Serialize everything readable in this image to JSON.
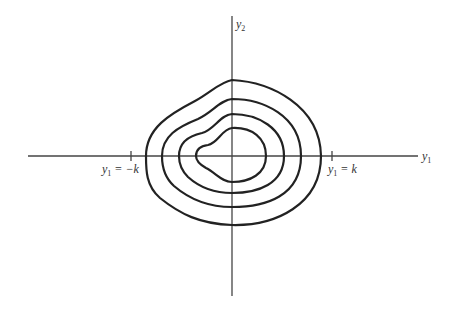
{
  "diagram": {
    "type": "contour-plot",
    "axes": {
      "x_label": "y",
      "x_label_sub": "1",
      "y_label": "y",
      "y_label_sub": "2"
    },
    "ticks": {
      "left": {
        "label_var": "y",
        "label_sub": "1",
        "label_rest": " = −k"
      },
      "right": {
        "label_var": "y",
        "label_sub": "1",
        "label_rest": " = k"
      }
    },
    "contours_count": 4,
    "colors": {
      "line": "#222222",
      "axis": "#444444",
      "background": "#ffffff"
    }
  }
}
